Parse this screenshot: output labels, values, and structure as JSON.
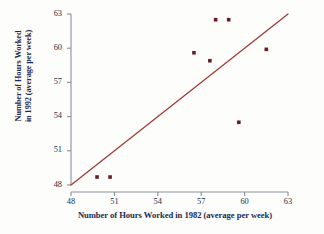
{
  "chart_data": {
    "type": "scatter",
    "title": "",
    "xlabel": "Number of Hours Worked in 1982 (average per week)",
    "ylabel_line1": "Number of Hours Worked",
    "ylabel_line2": "in 1992 (average per week)",
    "xlim": [
      48,
      63
    ],
    "ylim": [
      48,
      63
    ],
    "xticks": [
      48,
      51,
      54,
      57,
      60,
      63
    ],
    "yticks": [
      48,
      51,
      54,
      57,
      60,
      63
    ],
    "xtick_labels": [
      "48",
      "51",
      "54",
      "57",
      "60",
      "63"
    ],
    "ytick_labels": [
      "48",
      "51",
      "54",
      "57",
      "60",
      "63"
    ],
    "grid": false,
    "legend": "none",
    "point_color": "#6b1b26",
    "line_color": "#a33a33",
    "axis_color": "#8a8fa0",
    "points": [
      {
        "x": 49.8,
        "y": 48.7
      },
      {
        "x": 50.7,
        "y": 48.7
      },
      {
        "x": 56.5,
        "y": 59.6
      },
      {
        "x": 57.6,
        "y": 58.9
      },
      {
        "x": 58.0,
        "y": 62.5
      },
      {
        "x": 58.9,
        "y": 62.5
      },
      {
        "x": 59.6,
        "y": 53.5
      },
      {
        "x": 61.5,
        "y": 59.9
      }
    ],
    "reference_line": {
      "name": "equality-line",
      "x1": 48,
      "y1": 48,
      "x2": 63,
      "y2": 63
    }
  }
}
